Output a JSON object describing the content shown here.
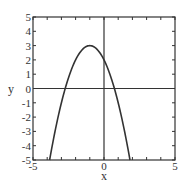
{
  "chart_data": {
    "type": "line",
    "title": "",
    "xlabel": "x",
    "ylabel": "y",
    "xlim": [
      -5,
      5
    ],
    "ylim": [
      -5,
      5
    ],
    "x_tick_labels": [
      "-5",
      "0",
      "5"
    ],
    "x_tick_values": [
      -5,
      0,
      5
    ],
    "y_tick_labels": [
      "5",
      "4",
      "3",
      "2",
      "1",
      "0",
      "-1",
      "-2",
      "-3",
      "-4",
      "-5"
    ],
    "y_tick_values": [
      5,
      4,
      3,
      2,
      1,
      0,
      -1,
      -2,
      -3,
      -4,
      -5
    ],
    "minor_x_ticks": [
      -4,
      -3,
      -2,
      -1,
      1,
      2,
      3,
      4
    ],
    "grid": false,
    "legend": null,
    "series": [
      {
        "name": "y = -x^2 - 2x + 2",
        "equation": "y = -(x+1)^2 + 3",
        "vertex": [
          -1,
          3
        ],
        "y_intercept": 2,
        "roots": [
          -2.73,
          0.73
        ],
        "x": [
          -3.83,
          -3.5,
          -3,
          -2.5,
          -2,
          -1.5,
          -1,
          -0.5,
          0,
          0.5,
          1,
          1.5,
          1.83
        ],
        "y": [
          -5,
          -3.25,
          -1,
          0.75,
          2,
          2.75,
          3,
          2.75,
          2,
          0.75,
          -1,
          -3.25,
          -5
        ]
      }
    ],
    "reference_lines": {
      "x_axis_at_y": 0,
      "y_axis_at_x": 0
    }
  },
  "colors": {
    "curve": "#333333",
    "frame": "#333333",
    "background": "#ffffff"
  }
}
